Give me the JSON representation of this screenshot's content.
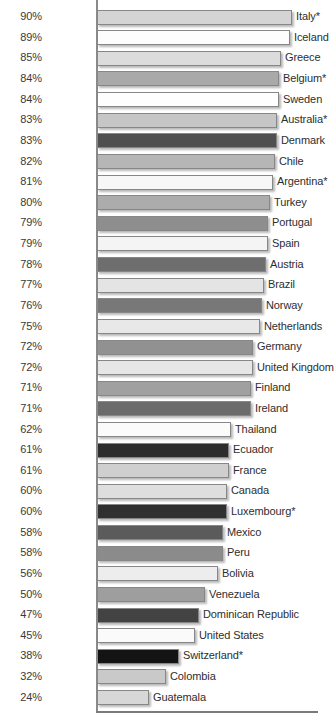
{
  "chart_data": {
    "type": "bar",
    "orientation": "horizontal",
    "title": "",
    "subtitle": "",
    "xlabel": "",
    "ylabel": "",
    "xlim": [
      0,
      90
    ],
    "grid": false,
    "legend": null,
    "value_suffix": "%",
    "note": "Asterisk (*) marks certain countries",
    "categories": [
      "Italy*",
      "Iceland",
      "Greece",
      "Belgium*",
      "Sweden",
      "Australia*",
      "Denmark",
      "Chile",
      "Argentina*",
      "Turkey",
      "Portugal",
      "Spain",
      "Austria",
      "Brazil",
      "Norway",
      "Netherlands",
      "Germany",
      "United Kingdom",
      "Finland",
      "Ireland",
      "Thailand",
      "Ecuador",
      "France",
      "Canada",
      "Luxembourg*",
      "Mexico",
      "Peru",
      "Bolivia",
      "Venezuela",
      "Dominican Republic",
      "United States",
      "Switzerland*",
      "Colombia",
      "Guatemala"
    ],
    "values": [
      90,
      89,
      85,
      84,
      84,
      83,
      83,
      82,
      81,
      80,
      79,
      79,
      78,
      77,
      76,
      75,
      72,
      72,
      71,
      71,
      62,
      61,
      61,
      60,
      60,
      58,
      58,
      56,
      50,
      47,
      45,
      38,
      32,
      24
    ],
    "value_labels": [
      "90%",
      "89%",
      "85%",
      "84%",
      "84%",
      "83%",
      "83%",
      "82%",
      "81%",
      "80%",
      "79%",
      "79%",
      "78%",
      "77%",
      "76%",
      "75%",
      "72%",
      "72%",
      "71%",
      "71%",
      "62%",
      "61%",
      "61%",
      "60%",
      "60%",
      "58%",
      "58%",
      "56%",
      "50%",
      "47%",
      "45%",
      "38%",
      "32%",
      "24%"
    ],
    "bar_colors": [
      "#d4d4d4",
      "#fdfdfd",
      "#dcdcdc",
      "#a9a9a9",
      "#fefefe",
      "#c6c6c6",
      "#4f4f4f",
      "#b6b6b6",
      "#f7f7f7",
      "#acacac",
      "#8e8e8e",
      "#f4f4f4",
      "#6e6e6e",
      "#e4e4e4",
      "#787878",
      "#e8e8e8",
      "#919191",
      "#e6e6e6",
      "#a0a0a0",
      "#6b6b6b",
      "#fbfbfb",
      "#2d2d2d",
      "#cfcfcf",
      "#dedede",
      "#303030",
      "#5b5b5b",
      "#8b8b8b",
      "#ededed",
      "#9e9e9e",
      "#434343",
      "#fafafa",
      "#141414",
      "#c9c9c9",
      "#d7d7d7"
    ],
    "axis_color": "#8a8a8a",
    "label_color": "#2e2e2e",
    "value_color": "#3a3a3a",
    "background": "#ffffff"
  }
}
